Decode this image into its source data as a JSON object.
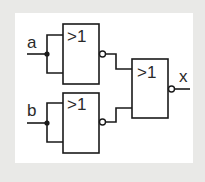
{
  "diagram": {
    "type": "logic-circuit",
    "colors": {
      "background": "#e9e9e7",
      "panel": "#ffffff",
      "line": "#1a1a1a"
    },
    "inputs": [
      {
        "label": "a"
      },
      {
        "label": "b"
      }
    ],
    "output": {
      "label": "x"
    },
    "gates": [
      {
        "id": "g1",
        "symbol": ">1",
        "type": "NOR",
        "inputs": [
          "a",
          "a"
        ]
      },
      {
        "id": "g2",
        "symbol": ">1",
        "type": "NOR",
        "inputs": [
          "b",
          "b"
        ]
      },
      {
        "id": "g3",
        "symbol": ">1",
        "type": "NOR",
        "inputs": [
          "g1",
          "g2"
        ]
      }
    ]
  }
}
